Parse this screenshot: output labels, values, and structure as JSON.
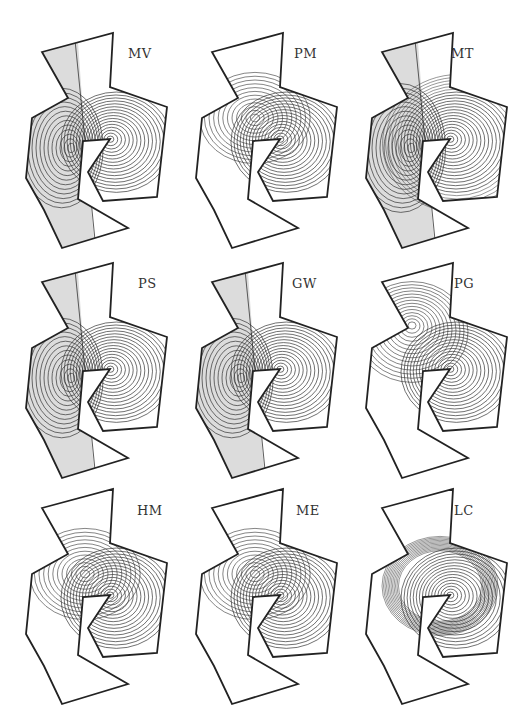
{
  "figure": {
    "layout": "3x3 grid of contour plots on an L-shaped/notched polygonal domain",
    "panels": [
      {
        "id": "MV",
        "label": "MV",
        "row": 0,
        "col": 0,
        "shaded_left": true,
        "style": "dipole"
      },
      {
        "id": "PM",
        "label": "PM",
        "row": 0,
        "col": 1,
        "shaded_left": false,
        "style": "swirl"
      },
      {
        "id": "MT",
        "label": "MT",
        "row": 0,
        "col": 2,
        "shaded_left": true,
        "style": "dense-dipole"
      },
      {
        "id": "PS",
        "label": "PS",
        "row": 1,
        "col": 0,
        "shaded_left": true,
        "style": "dipole"
      },
      {
        "id": "GW",
        "label": "GW",
        "row": 1,
        "col": 1,
        "shaded_left": true,
        "style": "dipole"
      },
      {
        "id": "PG",
        "label": "PG",
        "row": 1,
        "col": 2,
        "shaded_left": false,
        "style": "irregular"
      },
      {
        "id": "HM",
        "label": "HM",
        "row": 2,
        "col": 0,
        "shaded_left": false,
        "style": "swirl-dense-right"
      },
      {
        "id": "ME",
        "label": "ME",
        "row": 2,
        "col": 1,
        "shaded_left": false,
        "style": "swirl"
      },
      {
        "id": "LC",
        "label": "LC",
        "row": 2,
        "col": 2,
        "shaded_left": false,
        "style": "compact"
      }
    ],
    "colors": {
      "outline": "#222222",
      "contour": "#333333",
      "shade": "#dcdcdc",
      "background": "#ffffff"
    }
  }
}
